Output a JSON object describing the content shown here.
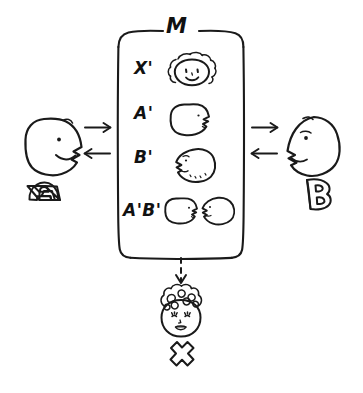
{
  "diagram": {
    "title_label": "M",
    "box": {
      "name": "M",
      "rows": [
        {
          "label": "X'",
          "icon": "curly-haired-smiling-face-icon"
        },
        {
          "label": "A'",
          "icon": "profile-face-right-icon"
        },
        {
          "label": "B'",
          "icon": "profile-face-left-icon"
        },
        {
          "label": "A'B'",
          "icon": "two-faces-facing-each-other-icon"
        }
      ]
    },
    "actors": [
      {
        "id": "A",
        "label": "A",
        "icon": "profile-face-right-icon",
        "side": "left"
      },
      {
        "id": "B",
        "label": "B",
        "icon": "profile-face-left-icon",
        "side": "right"
      }
    ],
    "arrows": {
      "left_to_box": "arrow-right-icon",
      "box_to_left": "arrow-left-icon",
      "right_to_box": "arrow-left-icon",
      "box_to_right": "arrow-right-icon",
      "box_to_result": "dashed-arrow-down-icon"
    },
    "result": {
      "label": "X",
      "icon": "curly-haired-face-icon"
    },
    "colors": {
      "ink": "#1a1a1a",
      "background": "#ffffff"
    }
  }
}
